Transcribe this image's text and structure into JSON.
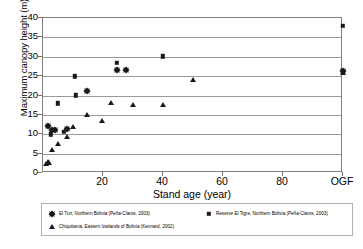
{
  "chart_data": {
    "type": "scatter",
    "title": "",
    "xlabel": "Stand age (year)",
    "ylabel": "Maximum canopy height (m)",
    "xlim": [
      0,
      100
    ],
    "ylim": [
      0,
      40
    ],
    "x_ticks": [
      {
        "value": 20,
        "label": "20"
      },
      {
        "value": 40,
        "label": "40"
      },
      {
        "value": 60,
        "label": "60"
      },
      {
        "value": 80,
        "label": "80"
      },
      {
        "value": 100,
        "label": "OGF"
      }
    ],
    "y_ticks": [
      {
        "value": 0,
        "label": "0"
      },
      {
        "value": 5,
        "label": "5"
      },
      {
        "value": 10,
        "label": "10"
      },
      {
        "value": 15,
        "label": "15"
      },
      {
        "value": 20,
        "label": "20"
      },
      {
        "value": 25,
        "label": "25"
      },
      {
        "value": 30,
        "label": "30"
      },
      {
        "value": 35,
        "label": "35"
      },
      {
        "value": 40,
        "label": "40"
      }
    ],
    "grid": "horizontal",
    "legend_position": "bottom",
    "series": [
      {
        "name": "El Turi, Northern Bolivia (Peña-Claros, 2003)",
        "marker": "diamond",
        "color": "#1a1a1a",
        "points": [
          {
            "x": 1.5,
            "y": 12.2
          },
          {
            "x": 3.0,
            "y": 11.2
          },
          {
            "x": 4.0,
            "y": 11.1
          },
          {
            "x": 8.0,
            "y": 11.3
          },
          {
            "x": 14.5,
            "y": 21.2
          },
          {
            "x": 24.5,
            "y": 26.7
          },
          {
            "x": 27.5,
            "y": 26.7
          },
          {
            "x": 100,
            "y": 26.3
          }
        ]
      },
      {
        "name": "Reserve El Tigre, Northern Bolivia (Peña-Claros, 2003)",
        "marker": "square",
        "color": "#1a1a1a",
        "points": [
          {
            "x": 2.5,
            "y": 10.0
          },
          {
            "x": 5.0,
            "y": 18.0
          },
          {
            "x": 7.0,
            "y": 10.6
          },
          {
            "x": 10.5,
            "y": 25.0
          },
          {
            "x": 11.0,
            "y": 20.1
          },
          {
            "x": 24.5,
            "y": 28.5
          },
          {
            "x": 40.0,
            "y": 30.1
          },
          {
            "x": 100,
            "y": 38.0
          }
        ]
      },
      {
        "name": "Chiquitania, Eastern lowlands of Bolivia (Kennard, 2002)",
        "marker": "triangle",
        "color": "#1a1a1a",
        "points": [
          {
            "x": 1.0,
            "y": 2.2
          },
          {
            "x": 1.5,
            "y": 2.9
          },
          {
            "x": 2.0,
            "y": 2.5
          },
          {
            "x": 3.0,
            "y": 5.9
          },
          {
            "x": 5.0,
            "y": 7.5
          },
          {
            "x": 8.0,
            "y": 9.4
          },
          {
            "x": 10.0,
            "y": 11.8
          },
          {
            "x": 14.5,
            "y": 15.0
          },
          {
            "x": 19.5,
            "y": 13.5
          },
          {
            "x": 22.5,
            "y": 18.0
          },
          {
            "x": 30.0,
            "y": 17.6
          },
          {
            "x": 40.0,
            "y": 17.6
          },
          {
            "x": 50.0,
            "y": 24.0
          },
          {
            "x": 100,
            "y": 25.8
          }
        ]
      }
    ]
  },
  "legend": {
    "entries": [
      {
        "label": "El Turi, Northern Bolivia (Peña-Claros, 2003)",
        "marker": "diamond"
      },
      {
        "label": "Reserve El Tigre, Northern Bolivia (Peña-Claros, 2003)",
        "marker": "square"
      },
      {
        "label": "Chiquitania, Eastern lowlands of Bolivia (Kennard, 2002)",
        "marker": "triangle"
      }
    ]
  }
}
